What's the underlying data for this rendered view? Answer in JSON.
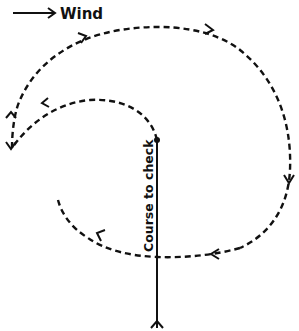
{
  "diagram": {
    "wind_label": "Wind",
    "course_label": "Course to check",
    "colors": {
      "ink": "#111111",
      "background": "#ffffff"
    },
    "elements": [
      {
        "name": "wind-arrow",
        "type": "arrow",
        "direction": "right"
      },
      {
        "name": "course-line",
        "type": "solid-line",
        "from": [
          157,
          325
        ],
        "to": [
          157,
          140
        ]
      },
      {
        "name": "search-path",
        "type": "dashed-spiral",
        "direction": "from course start outward, looping counter-clockwise"
      }
    ]
  }
}
